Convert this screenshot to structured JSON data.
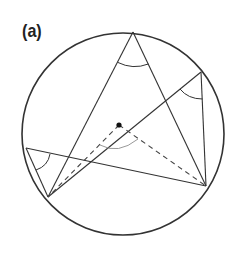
{
  "figure": {
    "label": "(a)",
    "colors": {
      "stroke": "#333333",
      "arc_center": "#999999",
      "dot": "#111111"
    },
    "circle": {
      "cx": 123,
      "cy": 134,
      "r": 101
    },
    "points": {
      "top": [
        133,
        32
      ],
      "right_upper": [
        201,
        72
      ],
      "right_lower": [
        206,
        186
      ],
      "left_upper": [
        26,
        148
      ],
      "left_lower": [
        48,
        197
      ],
      "center": [
        119,
        125
      ]
    },
    "solid_chords": [
      [
        "top",
        "left_lower"
      ],
      [
        "top",
        "right_lower"
      ],
      [
        "right_upper",
        "left_lower"
      ],
      [
        "right_upper",
        "right_lower"
      ],
      [
        "left_upper",
        "right_lower"
      ],
      [
        "left_upper",
        "left_lower"
      ]
    ],
    "dashed_radii": [
      [
        "center",
        "left_lower"
      ],
      [
        "center",
        "right_lower"
      ]
    ],
    "angle_marks": [
      "inscribed-angle-top",
      "inscribed-angle-right",
      "inscribed-angle-left",
      "central-angle"
    ]
  }
}
